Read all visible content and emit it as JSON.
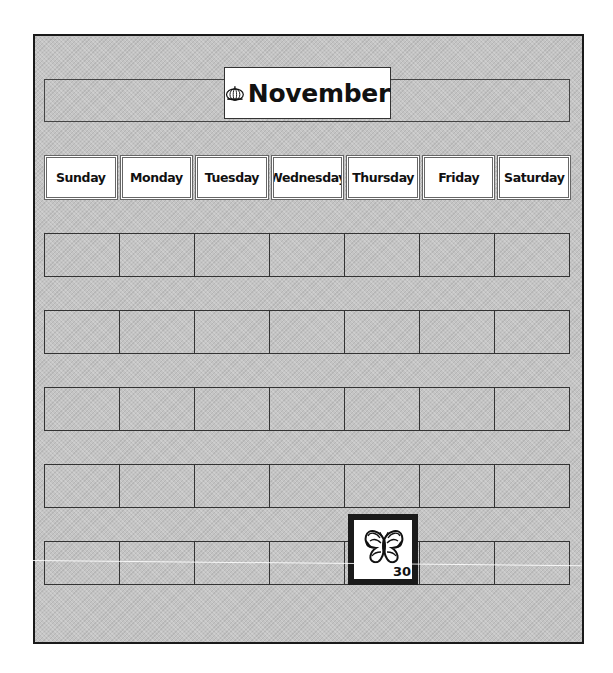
{
  "calendar": {
    "month": "November",
    "month_icon": "pumpkin-icon",
    "weekdays": [
      "Sunday",
      "Monday",
      "Tuesday",
      "Wednesday",
      "Thursday",
      "Friday",
      "Saturday"
    ],
    "weeks": 5,
    "placed_cards": [
      {
        "date": "30",
        "icon": "butterfly-icon",
        "week": 5,
        "weekday": "Thursday"
      }
    ]
  },
  "colors": {
    "board_bg": "#c4c4c4",
    "border": "#1a1a1a",
    "card_bg": "#ffffff"
  }
}
